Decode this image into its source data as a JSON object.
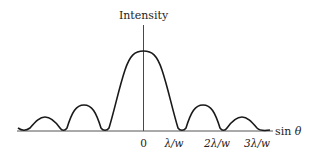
{
  "diagram": {
    "type": "single-slit diffraction intensity pattern",
    "y_axis_label": "Intensity",
    "x_axis_label": "sin θ",
    "x_axis_label_parts": {
      "func": "sin ",
      "var": "θ"
    },
    "tick_labels": [
      {
        "id": "zero",
        "text": "0",
        "value": 0
      },
      {
        "id": "one",
        "text": "λ/w",
        "value": 1
      },
      {
        "id": "two",
        "text": "2λ/w",
        "value": 2
      },
      {
        "id": "three",
        "text": "3λ/w",
        "value": 3
      }
    ],
    "curve": {
      "description": "Central maximum at 0 with symmetric secondary maxima decreasing in height; minima at integer multiples of lambda/w",
      "relative_peaks": [
        {
          "position": "central",
          "height": 1.0
        },
        {
          "position": "first secondary",
          "height": 0.32
        },
        {
          "position": "second secondary",
          "height": 0.16
        }
      ]
    },
    "colors": {
      "curve": "#1a1a1a",
      "axis": "#333333",
      "text": "#222222",
      "background": "#ffffff"
    }
  }
}
